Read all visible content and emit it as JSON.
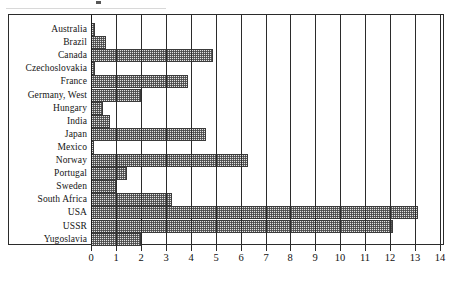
{
  "chart_data": {
    "type": "bar",
    "orientation": "horizontal",
    "title": "",
    "subtitle": "",
    "xlabel": "",
    "ylabel": "",
    "xlim": [
      0,
      14
    ],
    "ylim": null,
    "grid": true,
    "gridlines": "vertical",
    "legend": null,
    "legend_position": "none",
    "bar_fill": "#e3e3e3",
    "bar_pattern": "cross-hatch-dots",
    "bar_border": "#3a3a3a",
    "axis_color": "#2b2b2b",
    "categories": [
      "Australia",
      "Brazil",
      "Canada",
      "Czechoslovakia",
      "France",
      "Germany, West",
      "Hungary",
      "India",
      "Japan",
      "Mexico",
      "Norway",
      "Portugal",
      "Sweden",
      "South Africa",
      "USA",
      "USSR",
      "Yugoslavia"
    ],
    "values": [
      0.15,
      0.6,
      4.9,
      0.15,
      3.9,
      2.0,
      0.5,
      0.75,
      4.6,
      0.1,
      6.3,
      1.45,
      1.0,
      3.25,
      13.1,
      12.1,
      2.0
    ],
    "xticks": [
      0,
      1,
      2,
      3,
      4,
      5,
      6,
      7,
      8,
      9,
      10,
      11,
      12,
      13,
      14
    ],
    "xticklabels": [
      "0",
      "1",
      "2",
      "3",
      "4",
      "5",
      "6",
      "7",
      "8",
      "9",
      "10",
      "11",
      "12",
      "13",
      "14"
    ]
  }
}
